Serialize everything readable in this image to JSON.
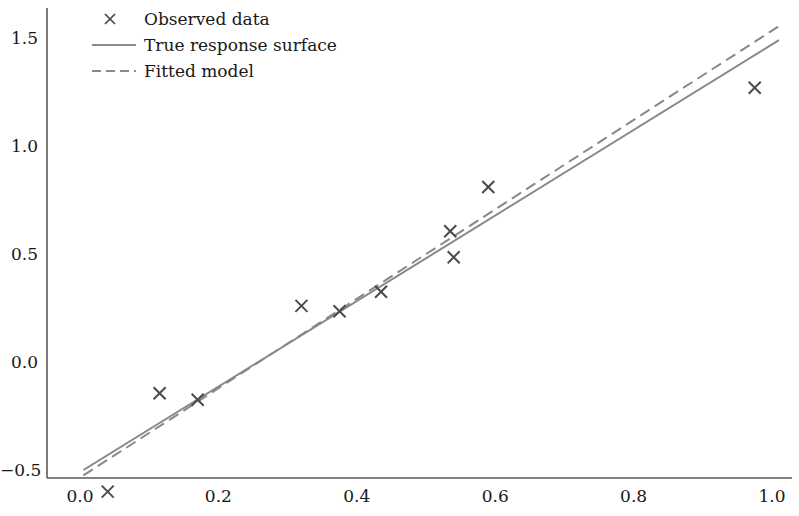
{
  "chart_data": {
    "type": "scatter",
    "title": "",
    "xlabel": "",
    "ylabel": "",
    "xlim": [
      -0.03,
      1.04
    ],
    "ylim": [
      -0.72,
      1.62
    ],
    "xticks": [
      "0.0",
      "0.2",
      "0.4",
      "0.6",
      "0.8",
      "1.0"
    ],
    "xtick_values": [
      0.0,
      0.2,
      0.4,
      0.6,
      0.8,
      1.0
    ],
    "yticks": [
      "1.5",
      "1.0",
      "0.5",
      "0.0",
      "−0.5"
    ],
    "ytick_values": [
      1.5,
      1.0,
      0.5,
      0.0,
      -0.5
    ],
    "grid": false,
    "legend_position": "upper left",
    "series": [
      {
        "name": "Observed data",
        "type": "scatter",
        "marker": "x",
        "color": "#4a4a4a",
        "points": [
          {
            "x": 0.04,
            "y": -0.6
          },
          {
            "x": 0.115,
            "y": -0.145
          },
          {
            "x": 0.17,
            "y": -0.175
          },
          {
            "x": 0.32,
            "y": 0.26
          },
          {
            "x": 0.375,
            "y": 0.235
          },
          {
            "x": 0.435,
            "y": 0.325
          },
          {
            "x": 0.535,
            "y": 0.605
          },
          {
            "x": 0.54,
            "y": 0.485
          },
          {
            "x": 0.59,
            "y": 0.81
          },
          {
            "x": 0.975,
            "y": 1.27
          }
        ]
      },
      {
        "name": "True response surface",
        "type": "line",
        "style": "solid",
        "color": "#888888",
        "x": [
          0.005,
          1.01
        ],
        "y": [
          -0.5,
          1.49
        ]
      },
      {
        "name": "Fitted model",
        "type": "line",
        "style": "dashed",
        "color": "#888888",
        "x": [
          0.005,
          1.01
        ],
        "y": [
          -0.525,
          1.555
        ]
      }
    ]
  },
  "legend": {
    "entries": [
      {
        "label": "Observed data",
        "symbol": "x-marker"
      },
      {
        "label": "True response surface",
        "symbol": "solid-line"
      },
      {
        "label": "Fitted model",
        "symbol": "dashed-line"
      }
    ]
  },
  "colors": {
    "axis": "#5a5a5a",
    "marker": "#4a4a4a",
    "true_line": "#8a8a8a",
    "fitted_line": "#8a8a8a",
    "background": "#ffffff"
  }
}
